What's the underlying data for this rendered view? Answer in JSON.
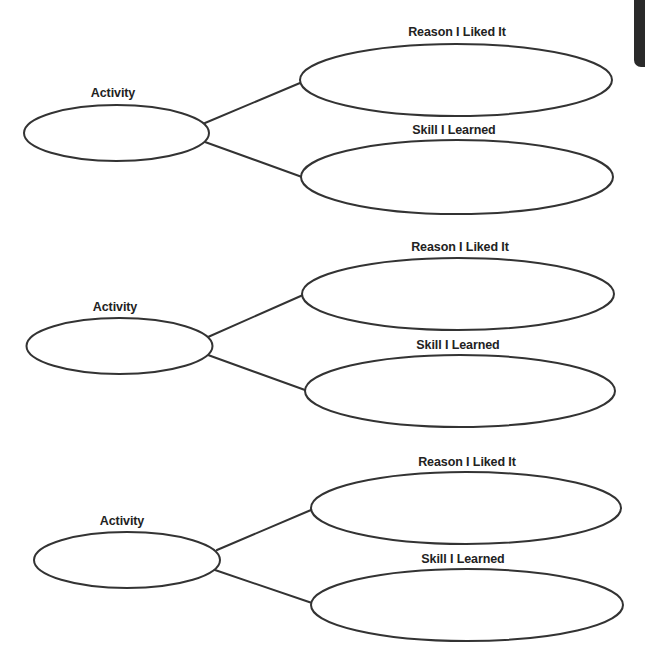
{
  "diagram": {
    "type": "web-organizer",
    "stroke_color": "#333333",
    "text_color": "#222222",
    "groups": [
      {
        "activity": {
          "label": "Activity",
          "cx": 116.5,
          "cy": 133,
          "rx": 92.5,
          "ry": 28,
          "label_x": 113,
          "label_y": 86
        },
        "reason": {
          "label": "Reason I Liked It",
          "cx": 456,
          "cy": 80,
          "rx": 156,
          "ry": 36,
          "label_x": 457,
          "label_y": 25
        },
        "skill": {
          "label": "Skill I Learned",
          "cx": 457,
          "cy": 177,
          "rx": 156,
          "ry": 37,
          "label_x": 454,
          "label_y": 123
        },
        "lines": [
          {
            "x1": 205,
            "y1": 123,
            "x2": 300,
            "y2": 83
          },
          {
            "x1": 205,
            "y1": 142,
            "x2": 302,
            "y2": 177
          }
        ]
      },
      {
        "activity": {
          "label": "Activity",
          "cx": 119.5,
          "cy": 346,
          "rx": 93,
          "ry": 28,
          "label_x": 115,
          "label_y": 300
        },
        "reason": {
          "label": "Reason I Liked It",
          "cx": 458,
          "cy": 294,
          "rx": 156,
          "ry": 36,
          "label_x": 460,
          "label_y": 240
        },
        "skill": {
          "label": "Skill I Learned",
          "cx": 460,
          "cy": 391,
          "rx": 155,
          "ry": 36,
          "label_x": 458,
          "label_y": 338
        },
        "lines": [
          {
            "x1": 208,
            "y1": 337,
            "x2": 303,
            "y2": 295
          },
          {
            "x1": 208,
            "y1": 355,
            "x2": 305,
            "y2": 390
          }
        ]
      },
      {
        "activity": {
          "label": "Activity",
          "cx": 127,
          "cy": 560,
          "rx": 93,
          "ry": 28,
          "label_x": 122,
          "label_y": 514
        },
        "reason": {
          "label": "Reason I Liked It",
          "cx": 466,
          "cy": 508,
          "rx": 155,
          "ry": 36,
          "label_x": 467,
          "label_y": 455
        },
        "skill": {
          "label": "Skill I Learned",
          "cx": 467,
          "cy": 605,
          "rx": 156,
          "ry": 36,
          "label_x": 463,
          "label_y": 552
        },
        "lines": [
          {
            "x1": 217,
            "y1": 550,
            "x2": 311,
            "y2": 510
          },
          {
            "x1": 215,
            "y1": 570,
            "x2": 312,
            "y2": 603
          }
        ]
      }
    ]
  },
  "edge_tab": {
    "color": "#2a2a2a"
  }
}
